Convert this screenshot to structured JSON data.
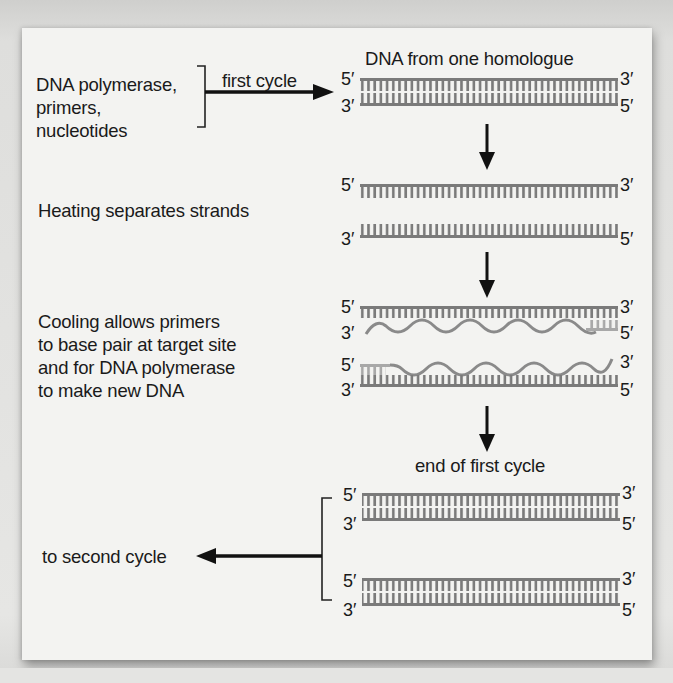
{
  "figure": {
    "title": "DNA from one homologue",
    "reagents_label": "DNA polymerase,\nprimers,\nnucleotides",
    "first_cycle_label": "first cycle",
    "steps": [
      {
        "id": "heating",
        "label": "Heating separates strands"
      },
      {
        "id": "cooling",
        "label": "Cooling allows primers\nto base pair at target site\nand for DNA polymerase\nto make new DNA"
      }
    ],
    "end_label": "end of first cycle",
    "second_cycle_label": "to second cycle",
    "end_labels": {
      "five_prime": "5′",
      "three_prime": "3′"
    },
    "colors": {
      "strand": "#7a7a7a",
      "primer": "#a8a8a8",
      "new_dna": "#8a8a8a",
      "arrow": "#111111",
      "text": "#1a1a1a",
      "panel": "#f3f3f1"
    },
    "stages": [
      {
        "name": "original-duplex",
        "strands": [
          {
            "top": "5′",
            "end": "3′"
          },
          {
            "top": "3′",
            "end": "5′"
          }
        ]
      },
      {
        "name": "separated-strands",
        "strands": [
          {
            "top": "5′",
            "end": "3′"
          },
          {
            "top": "3′",
            "end": "5′"
          }
        ]
      },
      {
        "name": "primed-and-extending",
        "duplexes": 2
      },
      {
        "name": "end-of-first-cycle",
        "duplexes": 2
      }
    ]
  }
}
